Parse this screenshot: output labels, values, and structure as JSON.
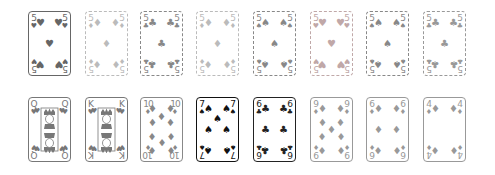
{
  "colors": {
    "dark": "#555555",
    "black": "#111111",
    "faint": "#bbbbbb",
    "mid": "#888888",
    "pinkfaint": "#c8a8a8"
  },
  "top_row": [
    {
      "rank": "5",
      "suit": "♥",
      "style": "solid",
      "color": "#666666",
      "x": 28,
      "y": 11
    },
    {
      "rank": "5",
      "suit": "♦",
      "style": "dashed",
      "color": "#bbbbbb",
      "x": 85,
      "y": 11
    },
    {
      "rank": "5",
      "suit": "♣",
      "style": "dashed",
      "color": "#888888",
      "x": 140,
      "y": 11
    },
    {
      "rank": "5",
      "suit": "♦",
      "style": "dashed",
      "color": "#bbbbbb",
      "x": 196,
      "y": 11
    },
    {
      "rank": "5",
      "suit": "♠",
      "style": "dashed",
      "color": "#888888",
      "x": 253,
      "y": 11
    },
    {
      "rank": "5",
      "suit": "♥",
      "style": "dashed",
      "color": "#c0a8a8",
      "x": 310,
      "y": 11
    },
    {
      "rank": "5",
      "suit": "♠",
      "style": "dashed",
      "color": "#888888",
      "x": 366,
      "y": 11
    },
    {
      "rank": "5",
      "suit": "♣",
      "style": "dashed",
      "color": "#999999",
      "x": 423,
      "y": 11
    }
  ],
  "bottom_row": [
    {
      "rank": "Q",
      "suit": "♥",
      "style": "solid",
      "color": "#777777",
      "x": 28,
      "y": 97,
      "face": true
    },
    {
      "rank": "K",
      "suit": "♥",
      "style": "solid",
      "color": "#777777",
      "x": 85,
      "y": 97,
      "face": true
    },
    {
      "rank": "10",
      "suit": "♦",
      "style": "solid",
      "color": "#888888",
      "x": 140,
      "y": 97
    },
    {
      "rank": "7",
      "suit": "♠",
      "style": "solid",
      "color": "#111111",
      "x": 196,
      "y": 97
    },
    {
      "rank": "6",
      "suit": "♣",
      "style": "solid",
      "color": "#222222",
      "x": 253,
      "y": 97
    },
    {
      "rank": "9",
      "suit": "♦",
      "style": "solid",
      "color": "#999999",
      "x": 310,
      "y": 97
    },
    {
      "rank": "6",
      "suit": "♦",
      "style": "solid",
      "color": "#999999",
      "x": 366,
      "y": 97
    },
    {
      "rank": "4",
      "suit": "♦",
      "style": "solid",
      "color": "#999999",
      "x": 423,
      "y": 97
    }
  ]
}
